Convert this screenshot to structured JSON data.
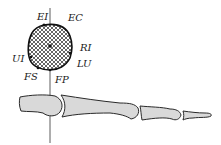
{
  "diagram": {
    "title": "",
    "cross_section": {
      "labels": {
        "ei": "EI",
        "ec": "EC",
        "ri": "RI",
        "lu": "LU",
        "ui": "UI",
        "fs": "FS",
        "fp": "FP"
      },
      "fill_pattern": "crosshatch",
      "outline_color": "#1a1a1a"
    },
    "bone_view": {
      "bones": [
        "metacarpal-head",
        "proximal-phalanx",
        "middle-phalanx",
        "distal-phalanx"
      ],
      "fill_color": "#d9d9d9",
      "outline_color": "#2a2a2a"
    },
    "axis_line_color": "#333333"
  }
}
